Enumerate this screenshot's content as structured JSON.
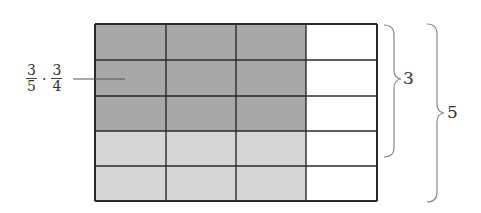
{
  "diagram": {
    "grid": {
      "rows": 5,
      "cols": 4,
      "shaded_rows": 3,
      "shaded_cols": 3,
      "light_rows": 5,
      "light_cols": 3
    },
    "label": {
      "frac1_num": "3",
      "frac1_den": "5",
      "operator": "·",
      "frac2_num": "3",
      "frac2_den": "4"
    },
    "brace_inner_label": "3",
    "brace_outer_label": "5",
    "colors": {
      "dark_fill": "#a8a8a8",
      "light_fill": "#d6d6d6",
      "empty_fill": "#ffffff",
      "grid_line": "#2a2a2a",
      "brace": "#888888"
    }
  }
}
